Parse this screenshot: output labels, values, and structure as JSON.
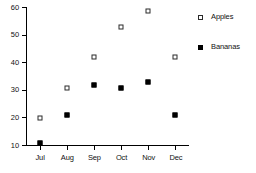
{
  "chart_data": {
    "type": "scatter",
    "title": "",
    "subtitle": "",
    "xlabel": "",
    "ylabel": "",
    "categories": [
      "Jul",
      "Aug",
      "Sep",
      "Oct",
      "Nov",
      "Dec"
    ],
    "series": [
      {
        "name": "Apples",
        "marker": "open-square",
        "color": "#2b2b2b",
        "fill": "#ffffff",
        "values": [
          21,
          32,
          43,
          54,
          60,
          43
        ]
      },
      {
        "name": "Bananas",
        "marker": "filled-square",
        "color": "#000000",
        "fill": "#000000",
        "values": [
          12,
          22,
          33,
          32,
          34,
          22
        ]
      }
    ],
    "ylim": [
      10,
      60
    ],
    "yticks": [
      10,
      20,
      30,
      40,
      50,
      60
    ],
    "ytick_labels": [
      "10",
      "20",
      "30",
      "40",
      "50",
      "60"
    ],
    "xtick_labels": [
      "Jul",
      "Aug",
      "Sep",
      "Oct",
      "Nov",
      "Dec"
    ],
    "grid": false,
    "legend_position": "right",
    "legend_entries": [
      "Apples",
      "Bananas"
    ]
  }
}
